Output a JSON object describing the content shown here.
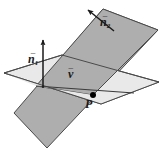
{
  "figure": {
    "width": 163,
    "height": 159,
    "background": "#ffffff",
    "colors": {
      "plane_light_fill": "#e9e9e9",
      "plane_dark_fill": "#aeaeae",
      "outline": "#3a3a3a",
      "label_color": "#1a1a1a",
      "point_color": "#000000",
      "arrow_color": "#1a1a1a"
    },
    "planes": [
      {
        "name": "horizontal-plane",
        "shade": "light",
        "fill": "#e9e9e9",
        "points": "4,73 62,55 159,82 101,104"
      },
      {
        "name": "tilted-plane",
        "shade": "dark",
        "fill": "#aeaeae",
        "points": "103,9 158,30 47,148 14,113"
      }
    ],
    "intersection_line": {
      "name": "intersection-line",
      "from": "36,86",
      "to": "130,92"
    },
    "point": {
      "name": "point-P",
      "x": 93,
      "y": 95,
      "radius": 3.0
    },
    "vectors": [
      {
        "name": "normal-vector-n1",
        "from": "43,88",
        "to": "43,36",
        "label": "n",
        "subscript": "1",
        "overbar": "–"
      },
      {
        "name": "normal-vector-n2",
        "from": "113,30",
        "to": "84,6",
        "label": "n",
        "subscript": "2",
        "overbar": "–"
      },
      {
        "name": "direction-vector-v",
        "label": "v",
        "subscript": "",
        "overbar": "–"
      }
    ],
    "labels": {
      "n1": "n",
      "n1_sub": "1",
      "n2": "n",
      "n2_sub": "2",
      "v": "v",
      "P": "P",
      "bar": "–"
    }
  }
}
